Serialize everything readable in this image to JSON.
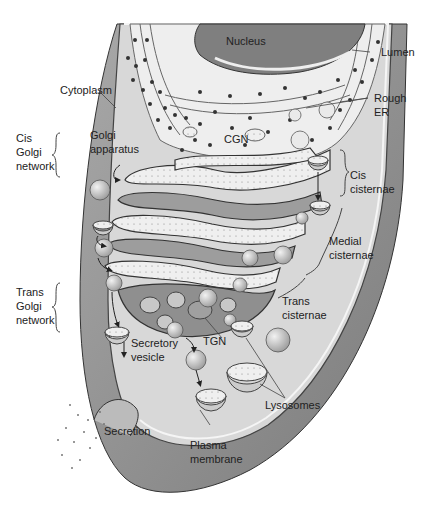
{
  "diagram": {
    "colors": {
      "cytoplasm": "#d6d6d6",
      "cell_wall_band": "#8e8e8e",
      "nucleus": "#7a7a7a",
      "er_lumen": "#ececec",
      "cisternae": "#9a9a9a",
      "vesicle": "#c4c4c4",
      "ribosome": "#333333"
    },
    "labels": {
      "nucleus": "Nucleus",
      "lumen": "Lumen",
      "cytoplasm": "Cytoplasm",
      "rough_er": "Rough\nER",
      "cis_golgi_network": "Cis\nGolgi\nnetwork",
      "golgi_apparatus": "Golgi\napparatus",
      "cgn": "CGN",
      "cis_cisternae": "Cis\ncisternae",
      "medial_cisternae": "Medial\ncisternae",
      "trans_golgi_network": "Trans\nGolgi\nnetwork",
      "trans_cisternae": "Trans\ncisternae",
      "tgn": "TGN",
      "secretory_vesicle": "Secretory\nvesicle",
      "lysosomes": "Lysosomes",
      "secretion": "Secretion",
      "plasma_membrane": "Plasma\nmembrane"
    }
  }
}
